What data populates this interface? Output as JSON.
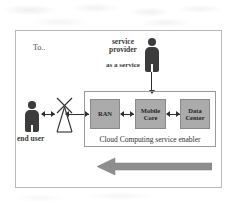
{
  "diagram": {
    "title_note": "To..",
    "frame": {
      "border_color": "#b9b9b9"
    },
    "actors": {
      "service_provider": {
        "label_line1": "service",
        "label_line2": "provider",
        "service_label": "as a service",
        "icon": "person-icon",
        "color": "#3c3c3c"
      },
      "end_user": {
        "label": "end user",
        "icon": "person-icon",
        "color": "#3c3c3c"
      },
      "antenna": {
        "icon": "antenna-tower-icon",
        "label": ""
      }
    },
    "cloud_container": {
      "label": "Cloud Computing service enabler",
      "border_color": "#9a9a9a",
      "nodes": [
        {
          "id": "ran",
          "label": "RAN",
          "fill": "#ababab"
        },
        {
          "id": "mobile-core",
          "label_line1": "Mobile",
          "label_line2": "Core",
          "fill": "#ababab"
        },
        {
          "id": "data-center",
          "label_line1": "Data",
          "label_line2": "Center",
          "fill": "#ababab"
        }
      ]
    },
    "flow_arrow": {
      "direction": "left",
      "label": "",
      "color": "#8e8e8e"
    },
    "connectors": {
      "user_to_antenna": "bidirectional",
      "antenna_to_ran": "bidirectional",
      "ran_to_core": "bidirectional",
      "core_to_datacenter": "bidirectional",
      "provider_to_cloud": "down"
    }
  }
}
